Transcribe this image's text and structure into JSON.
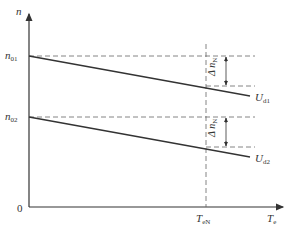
{
  "diagram": {
    "y_axis": {
      "label": "n",
      "label_sub": ""
    },
    "x_axis": {
      "label": "T",
      "label_sub": "e"
    },
    "origin": "0",
    "levels": [
      {
        "label": "n",
        "sub": "01"
      },
      {
        "label": "n",
        "sub": "02"
      }
    ],
    "marker": {
      "label": "T",
      "sub": "eN"
    },
    "lines": [
      {
        "label": "U",
        "sub": "d1"
      },
      {
        "label": "U",
        "sub": "d2"
      }
    ],
    "deltas": [
      {
        "label": "Δ n",
        "sub": "N"
      },
      {
        "label": "Δ n",
        "sub": "N"
      }
    ],
    "colors": {
      "line": "#333333",
      "dash": "#666666"
    }
  }
}
